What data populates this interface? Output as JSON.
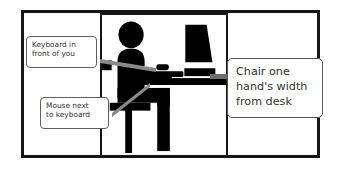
{
  "diagram": {
    "frame": {
      "border_color": "#151515",
      "background": "#ffffff"
    },
    "illustration": {
      "name": "seated-person-at-desk-silhouette",
      "silhouette_color": "#000000",
      "elements": [
        "person-head",
        "person-torso",
        "person-arm",
        "person-legs",
        "chair",
        "desk",
        "monitor",
        "keyboard",
        "mouse"
      ]
    },
    "callouts": [
      {
        "id": "keyboard",
        "name": "callout-keyboard",
        "lines": [
          "Keyboard in",
          "front of you"
        ],
        "points_to": "keyboard"
      },
      {
        "id": "mouse",
        "name": "callout-mouse",
        "lines": [
          "Mouse next",
          "to keyboard"
        ],
        "points_to": "mouse"
      },
      {
        "id": "chair",
        "name": "callout-chair",
        "lines": [
          "Chair one",
          "hand's width",
          "from desk"
        ],
        "points_to": "desk-edge"
      }
    ],
    "colors": {
      "outline": "#151515",
      "callout_border": "#5f5f5f",
      "callout_text": "#333333",
      "leader_line": "#7d7d7d",
      "silhouette": "#000000"
    }
  }
}
